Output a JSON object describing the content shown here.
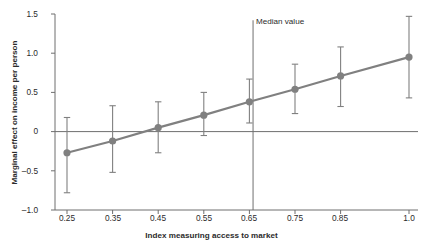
{
  "chart_data": {
    "type": "line",
    "title": "",
    "xlabel": "Index measuring access to market",
    "ylabel": "Marginal effect on income per person",
    "xlim": [
      0.2,
      1.05
    ],
    "ylim": [
      -1.0,
      1.5
    ],
    "grid": false,
    "legend": null,
    "x": [
      0.25,
      0.35,
      0.45,
      0.55,
      0.65,
      0.75,
      0.85,
      1.0
    ],
    "xtick_labels": [
      "0.25",
      "0.35",
      "0.45",
      "0.55",
      "0.65",
      "0.75",
      "0.85",
      "1.0"
    ],
    "ytick_labels": [
      "1.5",
      "1.0",
      "0.5",
      "0",
      "–0.5",
      "–1.0"
    ],
    "ytick_values": [
      1.5,
      1.0,
      0.5,
      0.0,
      -0.5,
      -1.0
    ],
    "series": [
      {
        "name": "Marginal effect",
        "values": [
          -0.27,
          -0.12,
          0.05,
          0.21,
          0.38,
          0.54,
          0.71,
          0.95
        ],
        "error_lower": [
          -0.78,
          -0.52,
          -0.27,
          -0.05,
          0.11,
          0.23,
          0.32,
          0.43
        ],
        "error_upper": [
          0.18,
          0.33,
          0.38,
          0.5,
          0.67,
          0.86,
          1.08,
          1.47
        ],
        "color": "#808080",
        "marker": "circle"
      }
    ],
    "annotations": [
      {
        "name": "median-value",
        "label": "Median value",
        "type": "vline",
        "x": 0.658
      }
    ],
    "reference_lines": [
      {
        "name": "zero-line",
        "y": 0.0
      }
    ],
    "colors": {
      "series": "#808080",
      "axis": "#6f6f6f",
      "zero_line": "#6f6f6f",
      "median_line": "#6f6f6f",
      "text": "#2b2b2b",
      "background": "#ffffff"
    }
  }
}
